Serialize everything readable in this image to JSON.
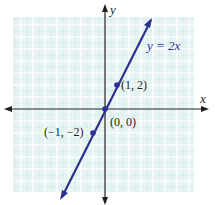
{
  "chart_data": {
    "type": "line",
    "title": "",
    "equation_label": "y = 2x",
    "xlabel": "x",
    "ylabel": "y",
    "xlim": [
      -7.5,
      7.5
    ],
    "ylim": [
      -7,
      8
    ],
    "grid": true,
    "series": [
      {
        "name": "y = 2x",
        "slope": 2,
        "intercept": 0,
        "x": [
          -3.6,
          3.8
        ],
        "y": [
          -7.2,
          7.6
        ]
      }
    ],
    "points": [
      {
        "x": 1,
        "y": 2,
        "label": "(1, 2)"
      },
      {
        "x": 0,
        "y": 0,
        "label": "(0, 0)"
      },
      {
        "x": -1,
        "y": -2,
        "label": "(−1, −2)"
      }
    ],
    "colors": {
      "line": "#2e3192",
      "grid_bg": "#e6f4f3",
      "grid_major": "#ffffff",
      "grid_minor": "#b8d8d8",
      "axis": "#231f20"
    }
  }
}
